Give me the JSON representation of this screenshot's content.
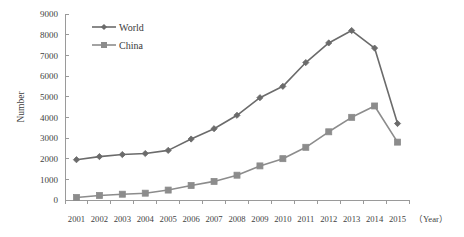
{
  "chart_data": {
    "type": "line",
    "title": "",
    "xlabel": "（Year）",
    "ylabel": "Number",
    "categories": [
      "2001",
      "2002",
      "2003",
      "2004",
      "2005",
      "2006",
      "2007",
      "2008",
      "2009",
      "2010",
      "2011",
      "2012",
      "2013",
      "2014",
      "2015"
    ],
    "ylim": [
      0,
      9000
    ],
    "ytick_step": 1000,
    "yticks": [
      "0",
      "1000",
      "2000",
      "3000",
      "4000",
      "5000",
      "6000",
      "7000",
      "8000",
      "9000"
    ],
    "grid": false,
    "legend_position": "top-left",
    "series": [
      {
        "name": "World",
        "marker": "diamond",
        "color": "#6b6b6b",
        "values": [
          1950,
          2100,
          2200,
          2250,
          2400,
          2950,
          3450,
          4100,
          4950,
          5500,
          6650,
          7600,
          8200,
          7350,
          3700
        ]
      },
      {
        "name": "China",
        "marker": "square",
        "color": "#8c8c8c",
        "values": [
          120,
          220,
          280,
          330,
          480,
          700,
          900,
          1200,
          1650,
          2000,
          2550,
          3300,
          4000,
          4550,
          2800
        ]
      }
    ]
  },
  "legend": {
    "items": [
      {
        "label": "World"
      },
      {
        "label": "China"
      }
    ]
  },
  "axes": {
    "y_title": "Number",
    "x_title": "（Year）"
  },
  "colors": {
    "world_series": "#6b6b6b",
    "china_series": "#8c8c8c",
    "axis": "#9a9a9a",
    "text": "#3f3f3f",
    "background": "#ffffff"
  }
}
